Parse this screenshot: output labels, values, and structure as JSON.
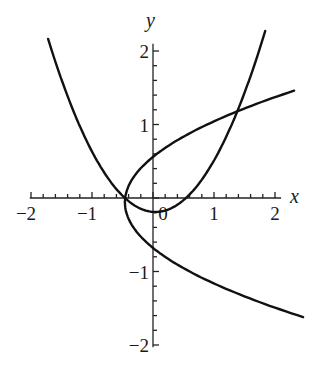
{
  "chart_data": {
    "type": "line",
    "title": "",
    "xlabel": "x",
    "ylabel": "y",
    "xlim": [
      -2,
      2.2
    ],
    "ylim": [
      -2,
      2.2
    ],
    "grid": false,
    "legend": null,
    "x_ticks": [
      {
        "value": -2,
        "label": "−2"
      },
      {
        "value": -1,
        "label": "−1"
      },
      {
        "value": 0,
        "label": "0"
      },
      {
        "value": 1,
        "label": "1"
      },
      {
        "value": 2,
        "label": "2"
      }
    ],
    "y_ticks": [
      {
        "value": 2,
        "label": "2"
      },
      {
        "value": 1,
        "label": "1"
      },
      {
        "value": -1,
        "label": "−1"
      },
      {
        "value": -2,
        "label": "−2"
      }
    ],
    "minor_tick_step": 0.2,
    "series": [
      {
        "name": "upward-parabola",
        "description": "y = 0.76(x - 0.04)^2 - 0.19",
        "orientation": "y_of_x",
        "a": 0.76,
        "h": 0.04,
        "k": -0.19,
        "domain": [
          -1.72,
          1.84
        ],
        "points": [
          [
            -1.72,
            2.17
          ],
          [
            -1.2,
            0.98
          ],
          [
            -0.8,
            0.35
          ],
          [
            -0.45,
            -0.01
          ],
          [
            0.04,
            -0.19
          ],
          [
            0.52,
            -0.01
          ],
          [
            1.0,
            0.51
          ],
          [
            1.43,
            1.2
          ],
          [
            1.84,
            2.27
          ]
        ]
      },
      {
        "name": "sideways-parabola",
        "description": "x = 1.2(y + 0.06)^2 - 0.46",
        "orientation": "x_of_y",
        "a": 1.2,
        "h": -0.06,
        "k": -0.46,
        "domain": [
          -1.62,
          1.46
        ],
        "points": [
          [
            2.46,
            -1.62
          ],
          [
            1.2,
            -1.2
          ],
          [
            0.0,
            -0.68
          ],
          [
            -0.46,
            -0.06
          ],
          [
            0.0,
            0.56
          ],
          [
            1.3,
            1.15
          ],
          [
            2.31,
            1.46
          ]
        ]
      }
    ],
    "intersections": [
      {
        "x": -0.45,
        "y": -0.01
      },
      {
        "x": 1.43,
        "y": 1.19
      }
    ]
  },
  "axes": {
    "x_name": "x",
    "y_name": "y"
  },
  "colors": {
    "curve": "#111111",
    "axis": "#222222",
    "background": "#ffffff"
  }
}
